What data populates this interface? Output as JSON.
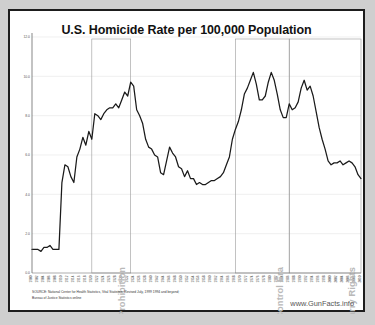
{
  "chart_data": {
    "type": "line",
    "title": "U.S. Homicide Rate per 100,000 Population",
    "xlabel": "",
    "ylabel": "",
    "ylim": [
      0.0,
      12.0
    ],
    "yticks": [
      "0.0",
      "2.0",
      "4.0",
      "6.0",
      "8.0",
      "10.0",
      "12.0"
    ],
    "ytick_values": [
      0.0,
      2.0,
      4.0,
      6.0,
      8.0,
      10.0,
      12.0
    ],
    "grid": true,
    "legend": "none",
    "x": [
      1900,
      1901,
      1902,
      1903,
      1904,
      1905,
      1906,
      1907,
      1908,
      1909,
      1910,
      1911,
      1912,
      1913,
      1914,
      1915,
      1916,
      1917,
      1918,
      1919,
      1920,
      1921,
      1922,
      1923,
      1924,
      1925,
      1926,
      1927,
      1928,
      1929,
      1930,
      1931,
      1932,
      1933,
      1934,
      1935,
      1936,
      1937,
      1938,
      1939,
      1940,
      1941,
      1942,
      1943,
      1944,
      1945,
      1946,
      1947,
      1948,
      1949,
      1950,
      1951,
      1952,
      1953,
      1954,
      1955,
      1956,
      1957,
      1958,
      1959,
      1960,
      1961,
      1962,
      1963,
      1964,
      1965,
      1966,
      1967,
      1968,
      1969,
      1970,
      1971,
      1972,
      1973,
      1974,
      1975,
      1976,
      1977,
      1978,
      1979,
      1980,
      1981,
      1982,
      1983,
      1984,
      1985,
      1986,
      1987,
      1988,
      1989,
      1990,
      1991,
      1992,
      1993,
      1994,
      1995,
      1996,
      1997,
      1998,
      1999,
      2000,
      2001,
      2002,
      2003,
      2004,
      2005,
      2006,
      2007,
      2008,
      2009,
      2010
    ],
    "values": [
      1.2,
      1.2,
      1.2,
      1.1,
      1.3,
      1.3,
      1.4,
      1.2,
      1.2,
      1.2,
      4.6,
      5.5,
      5.4,
      4.9,
      4.6,
      5.9,
      6.3,
      6.9,
      6.5,
      7.2,
      6.8,
      8.1,
      8.0,
      7.8,
      8.1,
      8.3,
      8.4,
      8.4,
      8.6,
      8.4,
      8.8,
      9.2,
      9.0,
      9.7,
      9.5,
      8.3,
      8.0,
      7.6,
      6.8,
      6.4,
      6.3,
      6.0,
      5.9,
      5.1,
      5.0,
      5.7,
      6.4,
      6.1,
      5.9,
      5.4,
      5.3,
      4.9,
      5.2,
      4.8,
      4.8,
      4.5,
      4.6,
      4.5,
      4.5,
      4.6,
      4.7,
      4.7,
      4.8,
      4.9,
      5.1,
      5.5,
      5.9,
      6.8,
      7.3,
      7.7,
      8.3,
      9.1,
      9.4,
      9.8,
      10.2,
      9.6,
      8.8,
      8.8,
      9.0,
      9.7,
      10.2,
      9.8,
      9.1,
      8.3,
      7.9,
      7.9,
      8.6,
      8.3,
      8.4,
      8.7,
      9.4,
      9.8,
      9.3,
      9.5,
      9.0,
      8.2,
      7.4,
      6.8,
      6.3,
      5.7,
      5.5,
      5.6,
      5.6,
      5.7,
      5.5,
      5.6,
      5.7,
      5.6,
      5.4,
      5.0,
      4.8
    ],
    "annotations": [
      {
        "label": "Prohibition",
        "start_year": 1920,
        "end_year": 1933,
        "type": "span-box"
      },
      {
        "label": "Modern American Gun Control Era",
        "start_year": 1968,
        "end_year": 1986,
        "type": "span-box"
      },
      {
        "label": "Expansion of Concealed Carry Rights",
        "start_year": 1986,
        "end_year": 2010,
        "type": "span-box"
      }
    ]
  },
  "source": {
    "line1": "SOURCE:  National Center for Health Statistics, Vital Statistics, Revised July, 1999  1994 and beyond;",
    "line2": "Bureau of Justice Statistics online"
  },
  "watermark": "www.GunFacts.info"
}
